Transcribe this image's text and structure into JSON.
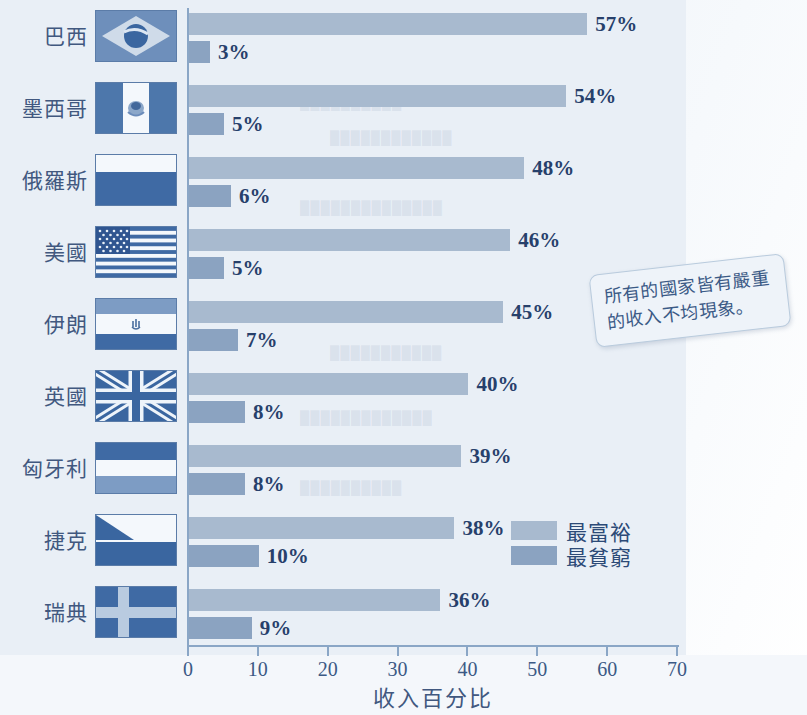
{
  "chart_data": {
    "type": "bar",
    "orientation": "horizontal",
    "title": "",
    "xlabel": "收入百分比",
    "ylabel": "",
    "xlim": [
      0,
      70
    ],
    "xticks": [
      0,
      10,
      20,
      30,
      40,
      50,
      60,
      70
    ],
    "grid": false,
    "legend_position": "inside-bottom-right",
    "categories": [
      "巴西",
      "墨西哥",
      "俄羅斯",
      "美國",
      "伊朗",
      "英國",
      "匈牙利",
      "捷克",
      "瑞典"
    ],
    "series": [
      {
        "name": "最富裕",
        "color": "#a8bacf",
        "values": [
          57,
          54,
          48,
          46,
          45,
          40,
          39,
          38,
          36
        ],
        "value_labels": [
          "57%",
          "54%",
          "48%",
          "46%",
          "45%",
          "40%",
          "39%",
          "38%",
          "36%"
        ]
      },
      {
        "name": "最貧窮",
        "color": "#8ba3c1",
        "values": [
          3,
          5,
          6,
          5,
          7,
          8,
          8,
          10,
          9
        ],
        "value_labels": [
          "3%",
          "5%",
          "6%",
          "5%",
          "7%",
          "8%",
          "8%",
          "10%",
          "9%"
        ]
      }
    ],
    "annotations": [
      "所有的國家皆有嚴重的收入不均現象。"
    ]
  },
  "axis": {
    "ticks": [
      "0",
      "10",
      "20",
      "30",
      "40",
      "50",
      "60",
      "70"
    ],
    "x_title": "收入百分比"
  },
  "rows": [
    {
      "country": "巴西",
      "flag": "flag-brazil",
      "rich": "57%",
      "poor": "3%"
    },
    {
      "country": "墨西哥",
      "flag": "flag-mexico",
      "rich": "54%",
      "poor": "5%"
    },
    {
      "country": "俄羅斯",
      "flag": "flag-russia",
      "rich": "48%",
      "poor": "6%"
    },
    {
      "country": "美國",
      "flag": "flag-usa",
      "rich": "46%",
      "poor": "5%"
    },
    {
      "country": "伊朗",
      "flag": "flag-iran",
      "rich": "45%",
      "poor": "7%"
    },
    {
      "country": "英國",
      "flag": "flag-uk",
      "rich": "40%",
      "poor": "8%"
    },
    {
      "country": "匈牙利",
      "flag": "flag-hungary",
      "rich": "39%",
      "poor": "8%"
    },
    {
      "country": "捷克",
      "flag": "flag-czech",
      "rich": "38%",
      "poor": "10%"
    },
    {
      "country": "瑞典",
      "flag": "flag-sweden",
      "rich": "36%",
      "poor": "9%"
    }
  ],
  "legend": {
    "rich_label": "最富裕",
    "poor_label": "最貧窮"
  },
  "callout": {
    "text": "所有的國家皆有嚴重的收入不均現象。"
  },
  "colors": {
    "rich_bar": "#a8bacf",
    "poor_bar": "#8ba3c1",
    "axis": "#8aa6c6",
    "value_text": "#27406b",
    "label_text": "#41587f",
    "plot_background": "#e9eff6",
    "flag_blue_dark": "#3a66a0",
    "flag_blue_mid": "#6e8fbb",
    "flag_white": "#f4f8fc"
  }
}
